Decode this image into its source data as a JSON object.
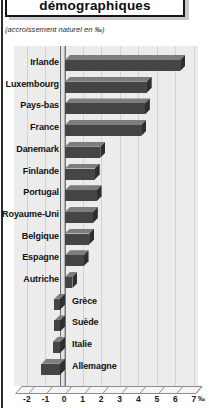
{
  "header": {
    "title": "démographiques",
    "subtitle": "(accroissement naturel en ‰)"
  },
  "chart_data": {
    "type": "bar",
    "orientation": "horizontal",
    "title": "démographiques",
    "note": "(accroissement naturel en ‰)",
    "unit": "‰",
    "categories": [
      "Irlande",
      "Luxembourg",
      "Pays-bas",
      "France",
      "Danemark",
      "Finlande",
      "Portugal",
      "Royaume-Uni",
      "Belgique",
      "Espagne",
      "Autriche",
      "Grèce",
      "Suède",
      "Italie",
      "Allemagne"
    ],
    "values": [
      6.2,
      4.4,
      4.3,
      4.1,
      1.9,
      1.6,
      1.7,
      1.5,
      1.3,
      1.0,
      0.4,
      -0.3,
      -0.3,
      -0.4,
      -1.0
    ],
    "x_ticks": [
      "-2",
      "-1",
      "0",
      "1",
      "2",
      "3",
      "4",
      "5",
      "6",
      "7"
    ],
    "x_tick_values": [
      -2,
      -1,
      0,
      1,
      2,
      3,
      4,
      5,
      6,
      7
    ],
    "xlim": [
      -2.7,
      7.2
    ],
    "grid": "vertical",
    "legend": "none",
    "negative_labels_side": "right-of-axis"
  },
  "colors": {
    "bar_face": "#454545",
    "bar_top": "#7d7d7d",
    "bar_side": "#2e2e2e",
    "plot_bg": "#ececec",
    "gridline": "#d2d2d2",
    "page_border": "#2c2c2c"
  }
}
